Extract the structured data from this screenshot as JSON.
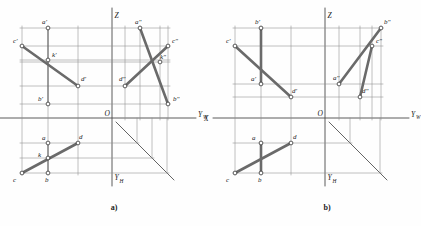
{
  "figure": {
    "caption_a": "a)",
    "caption_b": "b)",
    "stroke_color": "#555555",
    "thick_color": "#6a6a6a",
    "text_color": "#1b1b1b",
    "background": "#ffffff",
    "node_fill": "#ffffff"
  },
  "axes": {
    "x_label": "X",
    "z_label": "Z",
    "yw_label": "Y",
    "yw_sub": "W",
    "yh_label": "Y",
    "yh_sub": "H",
    "origin_label": "O"
  },
  "diagram_a": {
    "id": "a",
    "caption": "a)",
    "origin": {
      "x": 112,
      "y": 118
    },
    "points": [
      {
        "name": "a-prime",
        "label": "a'",
        "x": 48,
        "y": 28,
        "lx": 42,
        "ly": 24
      },
      {
        "name": "c-prime",
        "label": "c'",
        "x": 22,
        "y": 46,
        "lx": 13,
        "ly": 43
      },
      {
        "name": "k-prime",
        "label": "k'",
        "x": 48,
        "y": 60,
        "lx": 52,
        "ly": 57
      },
      {
        "name": "d-prime",
        "label": "d'",
        "x": 78,
        "y": 86,
        "lx": 81,
        "ly": 81
      },
      {
        "name": "b-prime",
        "label": "b'",
        "x": 48,
        "y": 104,
        "lx": 38,
        "ly": 101
      },
      {
        "name": "a-double-prime",
        "label": "a\"",
        "x": 140,
        "y": 28,
        "lx": 135,
        "ly": 24
      },
      {
        "name": "c-double-prime",
        "label": "c\"",
        "x": 168,
        "y": 46,
        "lx": 172,
        "ly": 43
      },
      {
        "name": "k-double-prime",
        "label": "k\"",
        "x": 160,
        "y": 62,
        "lx": 160,
        "ly": 59
      },
      {
        "name": "d-double-prime",
        "label": "d\"",
        "x": 125,
        "y": 86,
        "lx": 119,
        "ly": 81
      },
      {
        "name": "b-double-prime",
        "label": "b\"",
        "x": 168,
        "y": 104,
        "lx": 173,
        "ly": 101
      },
      {
        "name": "a-plan",
        "label": "a",
        "x": 48,
        "y": 143,
        "lx": 42,
        "ly": 140
      },
      {
        "name": "d-plan",
        "label": "d",
        "x": 78,
        "y": 143,
        "lx": 79,
        "ly": 139
      },
      {
        "name": "k-plan",
        "label": "k",
        "x": 48,
        "y": 158,
        "lx": 38,
        "ly": 157
      },
      {
        "name": "b-plan",
        "label": "b",
        "x": 48,
        "y": 173,
        "lx": 45,
        "ly": 182
      },
      {
        "name": "c-plan",
        "label": "c",
        "x": 22,
        "y": 173,
        "lx": 13,
        "ly": 182
      }
    ],
    "thick_segments": [
      {
        "name": "cd-frontal",
        "from": "c-prime",
        "to": "d-prime"
      },
      {
        "name": "ab-profile",
        "from": "a-double-prime",
        "to": "b-double-prime"
      },
      {
        "name": "cd-profile",
        "from": "c-double-prime",
        "to": "d-double-prime"
      },
      {
        "name": "cd-plan",
        "from": "c-plan",
        "to": "d-plan"
      }
    ],
    "thin_segments": [
      {
        "name": "ab-frontal",
        "from": "a-prime",
        "to": "b-prime"
      },
      {
        "name": "ab-plan",
        "from": "a-plan",
        "to": "b-plan"
      }
    ]
  },
  "diagram_b": {
    "id": "b",
    "caption": "b)",
    "origin": {
      "x": 325,
      "y": 118
    },
    "points": [
      {
        "name": "b-prime",
        "label": "b'",
        "x": 261,
        "y": 28,
        "lx": 255,
        "ly": 24
      },
      {
        "name": "c-prime",
        "label": "c'",
        "x": 235,
        "y": 46,
        "lx": 226,
        "ly": 43
      },
      {
        "name": "a-prime",
        "label": "a'",
        "x": 261,
        "y": 84,
        "lx": 251,
        "ly": 81
      },
      {
        "name": "d-prime",
        "label": "d'",
        "x": 291,
        "y": 97,
        "lx": 292,
        "ly": 93
      },
      {
        "name": "b-double-prime",
        "label": "b\"",
        "x": 381,
        "y": 28,
        "lx": 384,
        "ly": 24
      },
      {
        "name": "c-double-prime",
        "label": "c\"",
        "x": 372,
        "y": 46,
        "lx": 376,
        "ly": 43
      },
      {
        "name": "a-double-prime",
        "label": "a\"",
        "x": 339,
        "y": 84,
        "lx": 333,
        "ly": 80
      },
      {
        "name": "d-double-prime",
        "label": "d\"",
        "x": 360,
        "y": 97,
        "lx": 362,
        "ly": 93
      },
      {
        "name": "a-plan",
        "label": "a",
        "x": 261,
        "y": 143,
        "lx": 252,
        "ly": 140
      },
      {
        "name": "d-plan",
        "label": "d",
        "x": 291,
        "y": 143,
        "lx": 293,
        "ly": 139
      },
      {
        "name": "b-plan",
        "label": "b",
        "x": 261,
        "y": 173,
        "lx": 258,
        "ly": 182
      },
      {
        "name": "c-plan",
        "label": "c",
        "x": 235,
        "y": 173,
        "lx": 226,
        "ly": 182
      }
    ],
    "thick_segments": [
      {
        "name": "cd-frontal",
        "from": "c-prime",
        "to": "d-prime"
      },
      {
        "name": "ab-frontal",
        "from": "b-prime",
        "to": "a-prime"
      },
      {
        "name": "cd-profile",
        "from": "c-double-prime",
        "to": "d-double-prime"
      },
      {
        "name": "ab-profile",
        "from": "b-double-prime",
        "to": "a-double-prime"
      },
      {
        "name": "cd-plan",
        "from": "c-plan",
        "to": "d-plan"
      },
      {
        "name": "ab-plan",
        "from": "a-plan",
        "to": "b-plan"
      }
    ],
    "thin_segments": []
  }
}
